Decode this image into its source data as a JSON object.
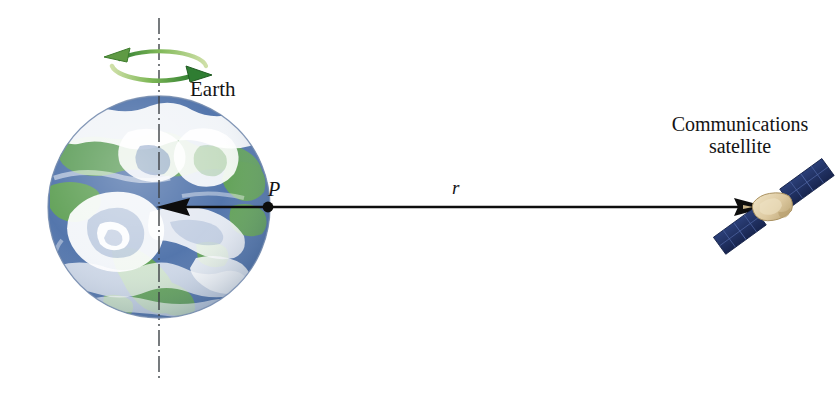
{
  "figure": {
    "background_color": "#ffffff",
    "width": 840,
    "height": 401
  },
  "labels": {
    "earth": "Earth",
    "point_p": "P",
    "radius": "r",
    "satellite_line1": "Communications",
    "satellite_line2": "satellite"
  },
  "earth": {
    "center_x": 159,
    "center_y": 207,
    "radius": 111,
    "ocean_color": "#4b6fa8",
    "land_color": "#5c9e52",
    "cloud_color": "#ffffff",
    "outline_color": "#7a8fb0"
  },
  "rotation_arrow": {
    "color_dark": "#2f7d32",
    "color_light": "#9cc96b",
    "center_x": 159,
    "center_y": 66,
    "rx": 47,
    "ry": 17,
    "direction": "counterclockwise-viewed-from-north"
  },
  "axis": {
    "color": "#555a5e",
    "style": "dash-dot",
    "top_y": 18,
    "bottom_y": 382,
    "x": 159
  },
  "radius_arrow": {
    "color": "#0d0d0d",
    "start_x": 765,
    "end_x": 158,
    "y": 207,
    "double_headed": true,
    "point_marker_x": 268,
    "point_marker_y": 207
  },
  "satellite": {
    "body_color": "#ddc9a0",
    "body_shadow_color": "#bda878",
    "panel_color": "#22356b",
    "panel_edge_color": "#101d42",
    "center_x": 773,
    "center_y": 207
  }
}
